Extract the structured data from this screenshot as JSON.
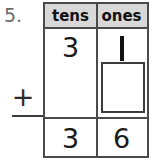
{
  "problem": {
    "number_label": "5.",
    "operator": "+",
    "operation_name": "addition"
  },
  "table": {
    "headers": [
      "tens",
      "ones"
    ],
    "rows": [
      {
        "role": "addend",
        "tens": "3",
        "ones": "1"
      },
      {
        "role": "addend-blank",
        "tens": "",
        "ones": ""
      },
      {
        "role": "sum",
        "tens": "3",
        "ones": "6"
      }
    ],
    "answer_box": {
      "label": "empty-answer-box",
      "value": ""
    }
  },
  "colors": {
    "header_fill": "#d8d8d8",
    "border": "#4a4a4a",
    "digit": "#1a1a1a",
    "problem_number": "#6d6d6d",
    "page_background": "#ffffff"
  }
}
